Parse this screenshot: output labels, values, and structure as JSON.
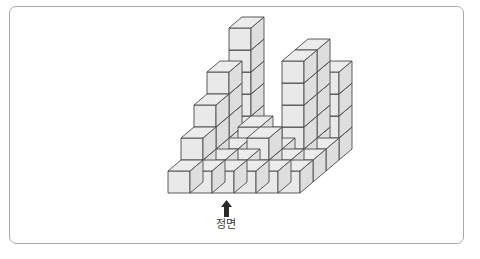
{
  "page": {
    "width": 480,
    "height": 259,
    "background": "#ffffff",
    "border_color": "#a9a9a9"
  },
  "figure": {
    "type": "isometric-cube-stack",
    "caption": "정면",
    "arrow_icon": "up-arrow-icon",
    "colors": {
      "top_face": "#ececec",
      "front_face": "#e9e9e9",
      "right_face": "#dedede",
      "outline": "#4a4a4a",
      "arrow": "#2b2b2b",
      "label": "#3a3a3a"
    },
    "projection": {
      "origin_x": 168,
      "origin_y": 193,
      "cube_width": 22,
      "cube_height": 22,
      "depth_dx": 13,
      "depth_dy": -11
    },
    "grid": {
      "columns": 6,
      "rows": 4,
      "note": "heights[row][col]; row 0 = front row nearest viewer, col 0 = leftmost"
    },
    "heights": [
      [
        1,
        1,
        1,
        1,
        1,
        1
      ],
      [
        2,
        1,
        1,
        2,
        1,
        1
      ],
      [
        3,
        1,
        2,
        1,
        5,
        1
      ],
      [
        4,
        6,
        1,
        1,
        5,
        4
      ]
    ]
  }
}
